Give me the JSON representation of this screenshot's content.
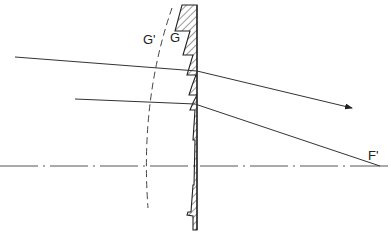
{
  "diagram": {
    "type": "optics",
    "labels": {
      "g_prime": "G'",
      "g": "G",
      "f_prime": "F'"
    },
    "colors": {
      "line": "#333333",
      "background": "#ffffff"
    },
    "elements": [
      {
        "name": "fresnel-lens",
        "description": "stepped lens with hatched cross-section, flat back face"
      },
      {
        "name": "optical-axis",
        "style": "dash-dot"
      },
      {
        "name": "equivalent-lens-surface-arc",
        "style": "dashed",
        "label": "G'"
      },
      {
        "name": "incident-ray-upper",
        "refracted": "arrow toward right"
      },
      {
        "name": "incident-ray-lower",
        "refracted": "converges to focal point F'"
      }
    ]
  }
}
